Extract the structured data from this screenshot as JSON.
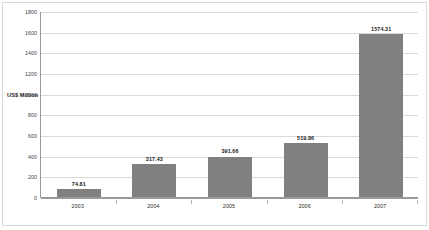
{
  "chart_data": {
    "type": "bar",
    "title": "",
    "subtitle": "",
    "xlabel": "",
    "ylabel": "US$ Million",
    "categories": [
      "2003",
      "2004",
      "2005",
      "2006",
      "2007"
    ],
    "values": [
      74.81,
      317.43,
      391.66,
      519.86,
      1574.31
    ],
    "data_labels": [
      "74.81",
      "317.43",
      "391.66",
      "519.86",
      "1574.31"
    ],
    "series": [
      {
        "name": "US$ Million",
        "values": [
          74.81,
          317.43,
          391.66,
          519.86,
          1574.31
        ]
      }
    ],
    "ylim": [
      0,
      1800
    ],
    "ytick_values": [
      0,
      200,
      400,
      600,
      800,
      1000,
      1200,
      1400,
      1600,
      1800
    ],
    "ytick_labels": [
      "0",
      "200",
      "400",
      "600",
      "800",
      "1000",
      "1200",
      "1400",
      "1600",
      "1800"
    ],
    "grid": "horizontal",
    "legend": "none",
    "bar_color": "#808080",
    "gridline_color": "#dadada",
    "axis_color": "#9a9a9a",
    "background_color": "#ffffff",
    "border_color": "#d8d8d8"
  }
}
